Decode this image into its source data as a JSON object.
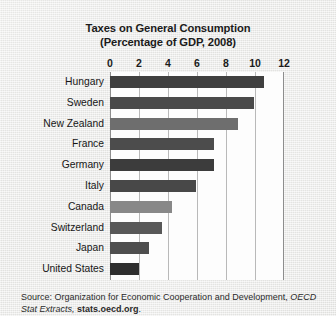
{
  "chart_data": {
    "type": "bar",
    "orientation": "horizontal",
    "title": "Taxes on General Consumption",
    "subtitle": "(Percentage of GDP, 2008)",
    "xlabel": "",
    "ylabel": "",
    "xlim": [
      0,
      12
    ],
    "xticks": [
      0,
      2,
      4,
      6,
      8,
      10,
      12
    ],
    "grid": true,
    "legend": "none",
    "categories": [
      "Hungary",
      "Sweden",
      "New Zealand",
      "France",
      "Germany",
      "Italy",
      "Canada",
      "Switzerland",
      "Japan",
      "United States"
    ],
    "values": [
      10.6,
      9.9,
      8.8,
      7.2,
      7.2,
      5.9,
      4.3,
      3.6,
      2.7,
      2.0
    ],
    "bar_colors": [
      "#3f3f3f",
      "#4a4a4a",
      "#6e6e6e",
      "#4c4c4c",
      "#3c3c3c",
      "#484848",
      "#888888",
      "#585858",
      "#4e4e4e",
      "#2e2e2e"
    ]
  },
  "source": {
    "prefix": "Source:",
    "organization": "Organization for Economic Cooperation and Development,",
    "publication": "OECD Stat Extracts,",
    "url": "stats.oecd.org",
    "period": "."
  },
  "colors": {
    "page_background": "#e9e9e7",
    "plot_background": "#fdfdfd",
    "gridline": "#b9b9b9",
    "axis": "#8d8d8d",
    "text": "#1b1b1b"
  }
}
